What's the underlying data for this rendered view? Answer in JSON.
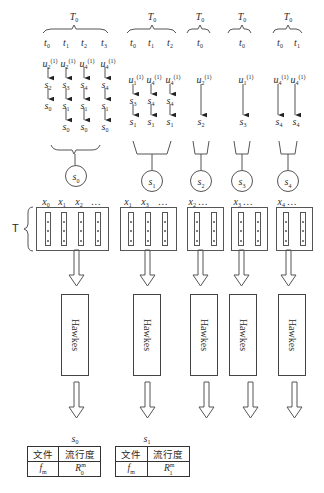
{
  "diagram": {
    "type": "popularity-prediction-pipeline",
    "colors": {
      "line": "#555555",
      "text": "#2a2a2a",
      "background": "#ffffff"
    },
    "side_label": "T",
    "groups": [
      {
        "id": "s0",
        "window": "T0",
        "times": [
          "t0",
          "t1",
          "t2",
          "t3"
        ],
        "inputs": [
          "u2(1)",
          "u2(1)",
          "u4(1)",
          "u4(1)"
        ],
        "chains": [
          [
            "s2",
            "s0"
          ],
          [
            "s3",
            "s1",
            "s0"
          ],
          [
            "s4",
            "s1",
            "s0"
          ],
          [
            "s4",
            "s1",
            "s0"
          ]
        ],
        "state": "s0",
        "sequence": [
          "x0",
          "x1",
          "x2",
          "…"
        ],
        "model": "Hawkes",
        "table": {
          "title": "s0",
          "headers": [
            "文件",
            "流行度"
          ],
          "row": [
            "f_m",
            "R_0^m"
          ]
        }
      },
      {
        "id": "s1",
        "window": "T0",
        "times": [
          "t0",
          "t1",
          "t2"
        ],
        "inputs": [
          "u1(1)",
          "u4(1)",
          "u4(1)"
        ],
        "chains": [
          [
            "s3",
            "s1"
          ],
          [
            "s4",
            "s1"
          ],
          [
            "s4",
            "s1"
          ]
        ],
        "state": "s1",
        "sequence": [
          "x1",
          "x3",
          "…"
        ],
        "model": "Hawkes",
        "table": {
          "title": "s1",
          "headers": [
            "文件",
            "流行度"
          ],
          "row": [
            "f_m",
            "R_1^m"
          ]
        }
      },
      {
        "id": "s2",
        "window": "T0",
        "times": [
          "t0"
        ],
        "inputs": [
          "u2(1)"
        ],
        "chains": [
          [
            "s2"
          ]
        ],
        "state": "s2",
        "sequence": [
          "x2",
          "…"
        ],
        "model": "Hawkes"
      },
      {
        "id": "s3",
        "window": "T0",
        "times": [
          "t0"
        ],
        "inputs": [
          "u1(1)"
        ],
        "chains": [
          [
            "s3"
          ]
        ],
        "state": "s3",
        "sequence": [
          "x3",
          "…"
        ],
        "model": "Hawkes"
      },
      {
        "id": "s4",
        "window": "T0",
        "times": [
          "t0",
          "t1"
        ],
        "inputs": [
          "u4(1)",
          "u4(1)"
        ],
        "chains": [
          [
            "s4"
          ],
          [
            "s4"
          ]
        ],
        "state": "s4",
        "sequence": [
          "x4",
          "…"
        ],
        "model": "Hawkes"
      }
    ],
    "tables": {
      "t0": {
        "title_base": "s",
        "title_sub": "0",
        "h1": "文件",
        "h2": "流行度",
        "file_base": "f",
        "file_sub": "m",
        "pop_base": "R",
        "pop_sup": "m",
        "pop_sub": "0"
      },
      "t1": {
        "title_base": "s",
        "title_sub": "1",
        "h1": "文件",
        "h2": "流行度",
        "file_base": "f",
        "file_sub": "m",
        "pop_base": "R",
        "pop_sup": "m",
        "pop_sub": "1"
      }
    },
    "hawkes_label": "Hawkes"
  }
}
